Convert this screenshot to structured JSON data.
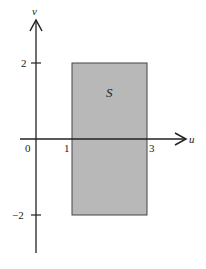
{
  "diagram": {
    "axes": {
      "x_label": "u",
      "y_label": "v",
      "origin_label": "0"
    },
    "x_ticks": [
      "1",
      "3"
    ],
    "y_ticks": [
      "2",
      "−2"
    ],
    "region": {
      "label": "S",
      "u_range": [
        1,
        3
      ],
      "v_range": [
        -2,
        2
      ],
      "fill": "#b5b5b5",
      "stroke": "#444444"
    }
  }
}
